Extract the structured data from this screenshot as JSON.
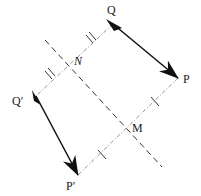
{
  "diagram": {
    "type": "geometry-reflection",
    "colors": {
      "vector": "#111111",
      "guide": "#888888",
      "mirror": "#333333",
      "background": "#ffffff"
    },
    "points": {
      "Q": {
        "label": "Q",
        "x": 113,
        "y": 24
      },
      "P": {
        "label": "P",
        "x": 178,
        "y": 78
      },
      "Q_prime": {
        "label": "Q′",
        "x": 36,
        "y": 96
      },
      "P_prime": {
        "label": "P′",
        "x": 78,
        "y": 175
      },
      "N": {
        "label": "N",
        "x": 70,
        "y": 59
      },
      "M": {
        "label": "M",
        "x": 127,
        "y": 126
      }
    },
    "labels": {
      "Q": "Q",
      "P": "P",
      "Q_prime": "Q′",
      "P_prime": "P′",
      "N": "N",
      "M": "M"
    },
    "segments": [
      {
        "name": "vector-QP",
        "from": "Q",
        "to": "P",
        "style": "solid-arrow"
      },
      {
        "name": "vector-QpPp",
        "from": "Q′",
        "to": "P′",
        "style": "solid-arrow"
      },
      {
        "name": "segment-QQp",
        "from": "Q",
        "to": "Q′",
        "style": "dash-dot",
        "tick_marks": "double"
      },
      {
        "name": "segment-PPp",
        "from": "P",
        "to": "P′",
        "style": "dash-dot",
        "tick_marks": "single"
      },
      {
        "name": "mirror-line",
        "from": [
          45,
          40
        ],
        "to": [
          162,
          167
        ],
        "style": "dashed"
      }
    ]
  }
}
